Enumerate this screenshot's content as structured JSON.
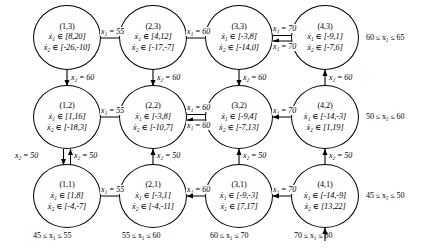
{
  "figure": {
    "type": "state-transition-diagram",
    "nodes": [
      {
        "id": "(1,3)",
        "x1": "ẋ₁ ∈ [8,20]",
        "x2": "ẋ₂ ∈ [-26,-10]",
        "col": 1,
        "row": 3
      },
      {
        "id": "(2,3)",
        "x1": "ẋ₁ ∈ [4,12]",
        "x2": "ẋ₂ ∈ [-17,-7]",
        "col": 2,
        "row": 3
      },
      {
        "id": "(3,3)",
        "x1": "ẋ₁ ∈ [-3,8]",
        "x2": "ẋ₂ ∈ [-14,0]",
        "col": 3,
        "row": 3
      },
      {
        "id": "(4,3)",
        "x1": "ẋ₁ ∈ [-9,1]",
        "x2": "ẋ₂ ∈ [-7,6]",
        "col": 4,
        "row": 3
      },
      {
        "id": "(1,2)",
        "x1": "ẋ₁ ∈ [1,16]",
        "x2": "ẋ₂ ∈ [-18,3]",
        "col": 1,
        "row": 2
      },
      {
        "id": "(2,2)",
        "x1": "ẋ₁ ∈ [-3,8]",
        "x2": "ẋ₂ ∈ [-10,7]",
        "col": 2,
        "row": 2
      },
      {
        "id": "(3,2)",
        "x1": "ẋ₁ ∈ [-9,4]",
        "x2": "ẋ₂ ∈ [-7,13]",
        "col": 3,
        "row": 2
      },
      {
        "id": "(4,2)",
        "x1": "ẋ₁ ∈ [-14,-3]",
        "x2": "ẋ₂ ∈ [1,19]",
        "col": 4,
        "row": 2
      },
      {
        "id": "(1,1)",
        "x1": "ẋ₁ ∈ [1,8]",
        "x2": "ẋ₂ ∈ [-4,-7]",
        "col": 1,
        "row": 1
      },
      {
        "id": "(2,1)",
        "x1": "ẋ₁ ∈ [-3,1]",
        "x2": "ẋ₂ ∈ [-4,-11]",
        "col": 2,
        "row": 1
      },
      {
        "id": "(3,1)",
        "x1": "ẋ₁ ∈ [-9,-3]",
        "x2": "ẋ₂ ∈ [7,17]",
        "col": 3,
        "row": 1
      },
      {
        "id": "(4,1)",
        "x1": "ẋ₁ ∈ [-14,-9]",
        "x2": "ẋ₂ ∈ [13,22]",
        "col": 4,
        "row": 1
      }
    ],
    "edge_labels": {
      "r3_c1c2": "x₁ = 55",
      "r3_c2c3": "x₁ = 60",
      "r3_c3c4_top": "x₁ = 70",
      "r3_c3c4_bottom": "x₁ = 70",
      "r2_c1c2": "x₁ = 55",
      "r2_c2c3_top": "x₁ = 60",
      "r2_c2c3_bottom": "x₁ = 60",
      "r2_c3c4": "x₁ = 70",
      "r1_c1c2": "x₁ = 55",
      "r1_c2c3": "x₁ = 60",
      "r1_c3c4": "x₁ = 70",
      "v_c1_r3r2": "x₂ = 60",
      "v_c2_r3r2": "x₂ = 60",
      "v_c3_r3r2": "x₂ = 60",
      "v_c4_r3r2": "x₂ = 60",
      "v_c1_r2r1_left": "x₂ = 50",
      "v_c1_r2r1_right": "x₂ = 50",
      "v_c2_r2r1": "x₂ = 50",
      "v_c3_r2r1": "x₂ = 50",
      "v_c4_r2r1": "x₂ = 50"
    },
    "row_labels": [
      "60 ≤ x₂ ≤ 65",
      "50 ≤ x₂ ≤ 60",
      "45 ≤ x₂ ≤ 50"
    ],
    "column_labels": [
      "45 ≤ x₁ ≤ 55",
      "55 ≤ x₁ ≤ 60",
      "60 ≤ x₁ ≤ 70",
      "70 ≤ x₁ ≤ 80"
    ]
  }
}
